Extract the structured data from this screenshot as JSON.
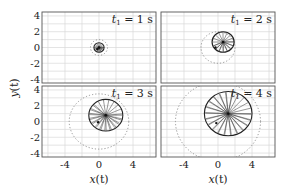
{
  "chart_data": {
    "type": "scatter",
    "title": "",
    "xlabel": "x(t)",
    "ylabel": "y(t)",
    "xlim": [
      -6.7,
      6.7
    ],
    "ylim": [
      -4.5,
      4.5
    ],
    "xticks": [
      -4,
      0,
      4
    ],
    "yticks": [
      4,
      2,
      0,
      -2,
      -4
    ],
    "grid": true,
    "layout": "2x2 panels, shared axes",
    "panels": [
      {
        "label": "t_1 = 1 s",
        "t": 1,
        "solid_circle": {
          "cx": 0.0,
          "cy": 0.0,
          "r": 0.6
        },
        "dashed_circle": {
          "cx": 0.0,
          "cy": 0.0,
          "r": 1.0
        },
        "spokes": 24,
        "marker": {
          "x": -0.2,
          "y": -0.2
        }
      },
      {
        "label": "t_1 = 2 s",
        "t": 2,
        "solid_circle": {
          "cx": 0.6,
          "cy": 0.7,
          "r": 1.3
        },
        "dashed_circle": {
          "cx": 0.0,
          "cy": 0.0,
          "r": 2.0
        },
        "spokes": 24,
        "marker": {
          "x": -0.3,
          "y": 0.0
        }
      },
      {
        "label": "t_1 = 3 s",
        "t": 3,
        "solid_circle": {
          "cx": 0.8,
          "cy": 0.8,
          "r": 2.0
        },
        "dashed_circle": {
          "cx": 0.0,
          "cy": 0.0,
          "r": 3.5
        },
        "spokes": 32,
        "marker": {
          "x": -0.1,
          "y": -0.1
        }
      },
      {
        "label": "t_1 = 4 s",
        "t": 4,
        "solid_circle": {
          "cx": 1.2,
          "cy": 1.0,
          "r": 2.8
        },
        "dashed_circle": {
          "cx": 0.0,
          "cy": 0.0,
          "r": 5.0
        },
        "spokes": 40,
        "marker": {
          "x": -0.2,
          "y": -0.2
        }
      }
    ]
  },
  "labels": {
    "xlabel_main": "x",
    "xlabel_arg": "(t)",
    "ylabel_main": "y",
    "ylabel_arg": "(t)",
    "panel_prefix": "t",
    "panel_sub": "1",
    "panel_texts": [
      "= 1 s",
      "= 2 s",
      "= 3 s",
      "= 4 s"
    ]
  }
}
